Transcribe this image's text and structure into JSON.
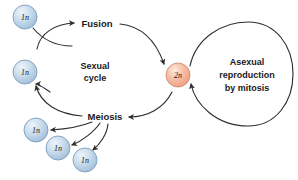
{
  "diagram": {
    "background_color": "#ffffff",
    "stroke_color": "#2f2f2f",
    "haploid_fill": "#bcd2e6",
    "haploid_stroke": "#7d9fbe",
    "diploid_fill": "#f4b79e",
    "diploid_stroke": "#d08c72",
    "stage_labels": {
      "fusion": "Fusion",
      "meiosis": "Meiosis"
    },
    "region_labels": {
      "sexual_cycle_line1": "Sexual",
      "sexual_cycle_line2": "cycle",
      "asexual_line1": "Asexual",
      "asexual_line2": "reproduction",
      "asexual_line3": "by mitosis"
    },
    "cells": [
      {
        "id": "gamete-top-left",
        "label": "1n",
        "cx": 25,
        "cy": 17,
        "r": 12,
        "ploidy": "haploid"
      },
      {
        "id": "gamete-mid-left",
        "label": "1n",
        "cx": 25,
        "cy": 72,
        "r": 12,
        "ploidy": "haploid"
      },
      {
        "id": "zygote",
        "label": "2n",
        "cx": 178,
        "cy": 75,
        "r": 12,
        "ploidy": "diploid"
      },
      {
        "id": "spore-lower-left",
        "label": "1n",
        "cx": 36,
        "cy": 130,
        "r": 12,
        "ploidy": "haploid"
      },
      {
        "id": "spore-lower-mid",
        "label": "1n",
        "cx": 58,
        "cy": 148,
        "r": 12,
        "ploidy": "haploid"
      },
      {
        "id": "spore-lower-right",
        "label": "1n",
        "cx": 85,
        "cy": 160,
        "r": 12,
        "ploidy": "haploid"
      }
    ]
  }
}
